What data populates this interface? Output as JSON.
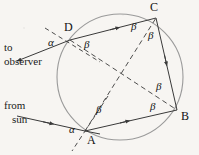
{
  "figure": {
    "kind": "geometry-diagram",
    "title_text": "",
    "background_color": "#f7f5f2",
    "stroke_color": "#3a3a3a",
    "circle_color": "#8d8d8d",
    "text_color": "#111111",
    "width": 199,
    "height": 155
  },
  "circle": {
    "cx": 120,
    "cy": 77,
    "r": 63,
    "label": "circle"
  },
  "points": [
    {
      "id": "A",
      "label": "A",
      "x": 85,
      "y": 131,
      "label_x": 86,
      "label_y": 133
    },
    {
      "id": "B",
      "label": "B",
      "x": 177,
      "y": 110,
      "label_x": 180,
      "label_y": 110
    },
    {
      "id": "C",
      "label": "C",
      "x": 156,
      "y": 18,
      "label_x": 151,
      "label_y": 2
    },
    {
      "id": "D",
      "label": "D",
      "x": 70,
      "y": 40,
      "label_x": 64,
      "label_y": 22
    }
  ],
  "angle_labels": [
    {
      "id": "alpha-D",
      "text": "α",
      "x": 51,
      "y": 42
    },
    {
      "id": "alpha-A",
      "text": "α",
      "x": 71,
      "y": 127
    },
    {
      "id": "beta-D",
      "text": "β",
      "x": 85,
      "y": 41
    },
    {
      "id": "beta-C1",
      "text": "β",
      "x": 132,
      "y": 23
    },
    {
      "id": "beta-C2",
      "text": "β",
      "x": 148,
      "y": 31
    },
    {
      "id": "beta-B1",
      "text": "β",
      "x": 157,
      "y": 84
    },
    {
      "id": "beta-B2",
      "text": "β",
      "x": 151,
      "y": 104
    },
    {
      "id": "beta-A",
      "text": "β",
      "x": 97,
      "y": 107
    }
  ],
  "callouts": [
    {
      "id": "to-observer",
      "line1": "to",
      "line2": "observer",
      "x": 5,
      "y": 46
    },
    {
      "id": "from-sun",
      "line1": "from",
      "line2": "sun",
      "x": 5,
      "y": 104
    }
  ],
  "rays": {
    "incoming_sun": {
      "from_x": 18,
      "from_y": 115,
      "to_x": 85,
      "to_y": 131,
      "label": "incoming-sun-ray"
    },
    "outgoing_observer": {
      "from_x": 70,
      "from_y": 40,
      "to_x": 20,
      "to_y": 60,
      "label": "outgoing-observer-ray"
    }
  },
  "chords": [
    {
      "id": "DC",
      "label": "chord-D-C",
      "x1": 70,
      "y1": 40,
      "x2": 156,
      "y2": 18
    },
    {
      "id": "CB",
      "label": "chord-C-B",
      "x1": 156,
      "y1": 18,
      "x2": 177,
      "y2": 110
    },
    {
      "id": "AB",
      "label": "chord-A-B",
      "x1": 85,
      "y1": 131,
      "x2": 177,
      "y2": 110
    }
  ],
  "dashed_lines": [
    {
      "id": "DB",
      "label": "dashed-diagonal-D-B",
      "x1": 70,
      "y1": 40,
      "x2": 177,
      "y2": 110
    },
    {
      "id": "AC",
      "label": "dashed-diagonal-A-C",
      "x1": 85,
      "y1": 131,
      "x2": 156,
      "y2": 18
    },
    {
      "id": "normal-D",
      "label": "dashed-normal-at-D",
      "x1": 46,
      "y1": 29,
      "x2": 97,
      "y2": 60
    },
    {
      "id": "normal-A",
      "label": "dashed-normal-at-A",
      "x1": 106,
      "y1": 98,
      "x2": 73,
      "y2": 150
    }
  ]
}
